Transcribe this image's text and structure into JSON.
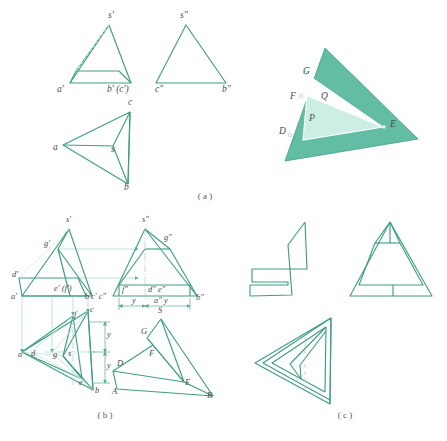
{
  "figure": {
    "title_caption_a": "( a )",
    "title_caption_b": "( b )",
    "title_caption_c": "( c )",
    "colors": {
      "line": "#3f9e82",
      "line_light": "#7cc4ae",
      "fill_dark": "#63bda4",
      "fill_light": "#cdeee2",
      "label": "#4a4a52",
      "caption": "#5a5a5a",
      "thin": "#86c9b4",
      "dash": "#b9d9cd"
    }
  },
  "part_a": {
    "front_view_labels": [
      {
        "id": "s-prime",
        "text": "s'",
        "x": 108,
        "y": 18
      },
      {
        "id": "a-prime",
        "text": "a'",
        "x": 57,
        "y": 92
      },
      {
        "id": "b-prime-c-prime",
        "text": "b' (c')",
        "x": 107,
        "y": 92
      }
    ],
    "side_view_labels": [
      {
        "id": "s-double-prime",
        "text": "s\"",
        "x": 180,
        "y": 18
      },
      {
        "id": "c-double-prime",
        "text": "c\"",
        "x": 155,
        "y": 92
      },
      {
        "id": "b-double-prime",
        "text": "b\"",
        "x": 222,
        "y": 92
      }
    ],
    "top_view_labels": [
      {
        "id": "c",
        "text": "c",
        "x": 128,
        "y": 105
      },
      {
        "id": "a",
        "text": "a",
        "x": 53,
        "y": 150
      },
      {
        "id": "s",
        "text": "s",
        "x": 111,
        "y": 152
      },
      {
        "id": "b",
        "text": "b",
        "x": 124,
        "y": 190
      }
    ],
    "pictorial_labels": [
      {
        "id": "G",
        "text": "G",
        "x": 303,
        "y": 74
      },
      {
        "id": "F",
        "text": "F",
        "x": 290,
        "y": 99
      },
      {
        "id": "Q",
        "text": "Q",
        "x": 321,
        "y": 99
      },
      {
        "id": "P",
        "text": "P",
        "x": 309,
        "y": 121
      },
      {
        "id": "D",
        "text": "D",
        "x": 279,
        "y": 134
      },
      {
        "id": "E",
        "text": "E",
        "x": 390,
        "y": 127
      }
    ]
  },
  "part_b": {
    "front_view_labels": [
      {
        "id": "s-prime",
        "text": "s'",
        "x": 66,
        "y": 222
      },
      {
        "id": "g-prime",
        "text": "g'",
        "x": 44,
        "y": 246
      },
      {
        "id": "d-prime",
        "text": "d'",
        "x": 12,
        "y": 277
      },
      {
        "id": "a-prime",
        "text": "a'",
        "x": 11,
        "y": 299
      },
      {
        "id": "e-prime-f-prime",
        "text": "e' (f')",
        "x": 54,
        "y": 291
      },
      {
        "id": "b-prime-c-prime-c-double-prime",
        "text": "b'c' c\"",
        "x": 85,
        "y": 299
      }
    ],
    "side_view_labels": [
      {
        "id": "s-double-prime",
        "text": "s\"",
        "x": 142,
        "y": 222
      },
      {
        "id": "g-double-prime",
        "text": "g\"",
        "x": 164,
        "y": 240
      },
      {
        "id": "f-double-prime",
        "text": "f\"",
        "x": 122,
        "y": 292
      },
      {
        "id": "d-double-prime-e-double-prime",
        "text": "d\" e\"",
        "x": 148,
        "y": 292
      },
      {
        "id": "b-double-prime",
        "text": "b\"",
        "x": 196,
        "y": 300
      },
      {
        "id": "y-left",
        "text": "y",
        "x": 132,
        "y": 303
      },
      {
        "id": "a-double-prime-y",
        "text": "a\" y",
        "x": 154,
        "y": 303
      }
    ],
    "top_view_labels": [
      {
        "id": "f",
        "text": "f",
        "x": 74,
        "y": 317
      },
      {
        "id": "c",
        "text": "c",
        "x": 90,
        "y": 312
      },
      {
        "id": "a",
        "text": "a",
        "x": 18,
        "y": 357
      },
      {
        "id": "d",
        "text": "d",
        "x": 31,
        "y": 356
      },
      {
        "id": "g",
        "text": "g",
        "x": 53,
        "y": 357
      },
      {
        "id": "s",
        "text": "s",
        "x": 68,
        "y": 356
      },
      {
        "id": "e",
        "text": "e",
        "x": 79,
        "y": 385
      },
      {
        "id": "b",
        "text": "b",
        "x": 95,
        "y": 393
      },
      {
        "id": "y-upper",
        "text": "y",
        "x": 107,
        "y": 337
      },
      {
        "id": "y-lower",
        "text": "y",
        "x": 107,
        "y": 368
      }
    ],
    "pictorial_labels": [
      {
        "id": "S",
        "text": "S",
        "x": 158,
        "y": 313
      },
      {
        "id": "G",
        "text": "G",
        "x": 141,
        "y": 334
      },
      {
        "id": "F",
        "text": "F",
        "x": 149,
        "y": 356
      },
      {
        "id": "D",
        "text": "D",
        "x": 117,
        "y": 366
      },
      {
        "id": "A",
        "text": "A",
        "x": 112,
        "y": 394
      },
      {
        "id": "E",
        "text": "E",
        "x": 185,
        "y": 385
      },
      {
        "id": "B",
        "text": "B",
        "x": 207,
        "y": 398
      }
    ]
  },
  "part_c": {
    "view_names": [
      "front-view",
      "side-view",
      "top-view"
    ]
  }
}
